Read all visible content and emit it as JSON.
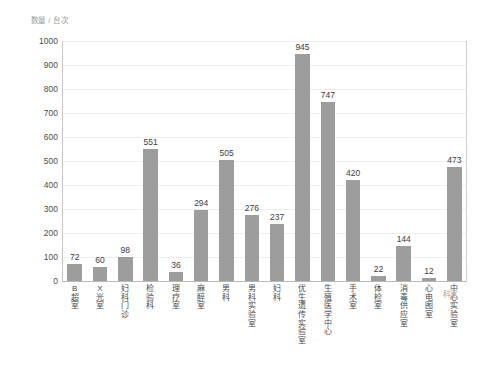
{
  "chart_data": {
    "type": "bar",
    "title": "",
    "subtitle": "",
    "ylabel": "数量 / 台次",
    "xlabel": "科室",
    "ylim": [
      0,
      1000
    ],
    "ytick_step": 100,
    "yticks": [
      "1000",
      "900",
      "800",
      "700",
      "600",
      "500",
      "400",
      "300",
      "200",
      "100",
      "0"
    ],
    "grid": true,
    "legend": "none",
    "bar_color": "#9d9d9d",
    "gridline_color": "#ededed",
    "axis_color": "#c9c9c9",
    "categories": [
      "B超室",
      "X光室",
      "妇科门诊",
      "检验科",
      "理疗室",
      "麻醉室",
      "男科",
      "男科实验室",
      "妇科",
      "优生遗传实验室",
      "生殖医学中心",
      "手术室",
      "体检室",
      "消毒供应室",
      "心电图室",
      "中心实验室"
    ],
    "values": [
      72,
      60,
      98,
      551,
      36,
      294,
      505,
      276,
      237,
      945,
      747,
      420,
      22,
      144,
      12,
      473
    ],
    "data_labels": [
      "72",
      "60",
      "98",
      "551",
      "36",
      "294",
      "505",
      "276",
      "237",
      "945",
      "747",
      "420",
      "22",
      "144",
      "12",
      "473"
    ]
  }
}
